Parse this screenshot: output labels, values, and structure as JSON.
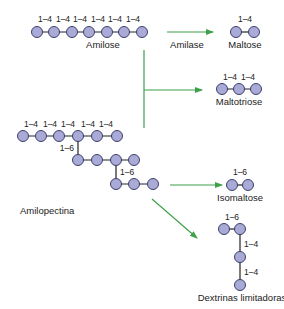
{
  "diagram": {
    "colors": {
      "glucose_fill": "#a9abd6",
      "glucose_stroke": "#3c3f6e",
      "bond": "#222222",
      "arrow": "#3fa04a"
    },
    "amilose": {
      "label": "Amilose",
      "bonds": [
        "1–4",
        "1–4",
        "1–4",
        "1–4",
        "1–4",
        "1–4"
      ]
    },
    "amilopectina": {
      "label": "Amilopectina",
      "row1_bonds": [
        "1–4",
        "1–4",
        "1–4",
        "1–4",
        "1–4"
      ],
      "branch1": "1–6",
      "branch2": "1–6"
    },
    "enzyme": {
      "label": "Amilase"
    },
    "products": {
      "maltose": {
        "label": "Maltose",
        "bonds": [
          "1–4"
        ]
      },
      "maltotriose": {
        "label": "Maltotriose",
        "bonds": [
          "1–4",
          "1–4"
        ]
      },
      "isomaltose": {
        "label": "Isomaltose",
        "bonds": [
          "1–6"
        ]
      },
      "dextrinas": {
        "label": "Dextrinas limitadoras",
        "bonds": [
          "1–6",
          "1–4",
          "1–4"
        ]
      }
    }
  }
}
